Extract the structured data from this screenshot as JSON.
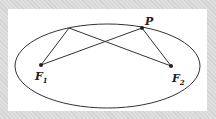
{
  "diagram": {
    "type": "ellipse-foci",
    "colors": {
      "frame": "#d6d6d6",
      "panel": "#ffffff",
      "stroke": "#333333"
    },
    "ellipse": {
      "cx": 107.5,
      "cy": 66,
      "rx": 92.5,
      "ry": 42
    },
    "points": {
      "P": {
        "label": "P",
        "x": 142,
        "y": 28
      },
      "Q": {
        "label": "",
        "x": 69,
        "y": 28
      },
      "F1": {
        "label": "F",
        "sub": "1",
        "x": 41,
        "y": 65
      },
      "F2": {
        "label": "F",
        "sub": "2",
        "x": 171,
        "y": 66
      }
    },
    "segments": [
      {
        "from": "F1",
        "to": "P"
      },
      {
        "from": "P",
        "to": "F2"
      },
      {
        "from": "F1",
        "to": "Q"
      },
      {
        "from": "Q",
        "to": "F2"
      }
    ]
  }
}
